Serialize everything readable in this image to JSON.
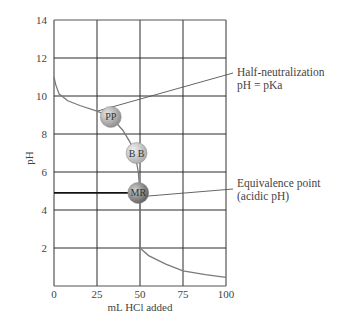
{
  "chart_data": {
    "type": "line",
    "title": "",
    "xlabel": "mL HCl added",
    "ylabel": "pH",
    "xlim": [
      0,
      100
    ],
    "ylim": [
      0,
      14
    ],
    "grid": true,
    "x_ticks": [
      0,
      25,
      50,
      75,
      100
    ],
    "y_ticks": [
      2,
      4,
      6,
      8,
      10,
      12,
      14
    ],
    "series": [
      {
        "name": "Titration curve (weak base with HCl)",
        "points": [
          [
            0,
            11.0
          ],
          [
            1,
            10.6
          ],
          [
            3,
            10.1
          ],
          [
            8,
            9.75
          ],
          [
            15,
            9.5
          ],
          [
            25,
            9.2
          ],
          [
            33,
            8.9
          ],
          [
            40,
            8.2
          ],
          [
            44,
            7.6
          ],
          [
            47,
            7.0
          ],
          [
            49,
            6.0
          ],
          [
            50,
            4.9
          ],
          [
            50,
            2.0
          ],
          [
            55,
            1.6
          ],
          [
            65,
            1.15
          ],
          [
            75,
            0.8
          ],
          [
            88,
            0.6
          ],
          [
            100,
            0.45
          ]
        ]
      }
    ],
    "markers": [
      {
        "label": "PP",
        "x": 33,
        "y": 8.9,
        "shade": "#9e9e9e"
      },
      {
        "label": "B B",
        "x": 48,
        "y": 7.0,
        "shade": "#bdbdbd"
      },
      {
        "label": "MR",
        "x": 49,
        "y": 4.9,
        "shade": "#7e7e7e"
      }
    ],
    "reference_line": {
      "from_x": 0,
      "to_x": 49,
      "y": 4.9
    },
    "annotations": [
      {
        "lines": [
          "Half-neutralization",
          "pH = pKa"
        ],
        "point_x": 25,
        "point_y": 9.2
      },
      {
        "lines": [
          "Equivalence point",
          "(acidic pH)"
        ],
        "point_x": 50,
        "point_y": 4.7
      }
    ]
  },
  "labels": {
    "x_axis": "mL HCl added",
    "y_axis": "pH",
    "half_neutralization": "Half-neutralization",
    "half_neutralization_eq": "pH = pKa",
    "equivalence": "Equivalence point",
    "equivalence_note": "(acidic pH)"
  }
}
